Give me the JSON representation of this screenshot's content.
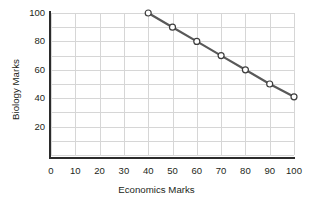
{
  "chart_data": {
    "type": "line",
    "title": "",
    "xlabel": "Economics Marks",
    "ylabel": "Biology Marks",
    "xlim": [
      0,
      100
    ],
    "ylim": [
      0,
      100
    ],
    "grid": true,
    "legend": "none",
    "x_ticks": [
      0,
      10,
      20,
      30,
      40,
      50,
      60,
      70,
      80,
      90,
      100
    ],
    "x_tick_labels": [
      "0",
      "10",
      "20",
      "30",
      "40",
      "50",
      "60",
      "70",
      "80",
      "90",
      "100"
    ],
    "y_ticks": [
      20,
      40,
      60,
      80,
      100
    ],
    "y_tick_labels": [
      "20",
      "40",
      "60",
      "80",
      "100"
    ],
    "x_gridline_step": 10,
    "y_gridline_step": 10,
    "series": [
      {
        "name": "Economics vs Biology",
        "marker": "open-circle",
        "line_color": "#595959",
        "marker_face_color": "#ffffff",
        "marker_edge_color": "#3d3d3d",
        "x": [
          40,
          50,
          60,
          70,
          80,
          90,
          100
        ],
        "y": [
          100,
          90,
          80,
          70,
          60,
          50,
          41
        ],
        "points": [
          {
            "x": 40,
            "y": 100
          },
          {
            "x": 50,
            "y": 90
          },
          {
            "x": 60,
            "y": 80
          },
          {
            "x": 70,
            "y": 70
          },
          {
            "x": 80,
            "y": 60
          },
          {
            "x": 90,
            "y": 50
          },
          {
            "x": 100,
            "y": 41
          }
        ]
      }
    ]
  },
  "colors": {
    "axis": "#2b2b2b",
    "grid": "#d6d6d6",
    "background": "#ffffff",
    "text": "#231f20"
  }
}
